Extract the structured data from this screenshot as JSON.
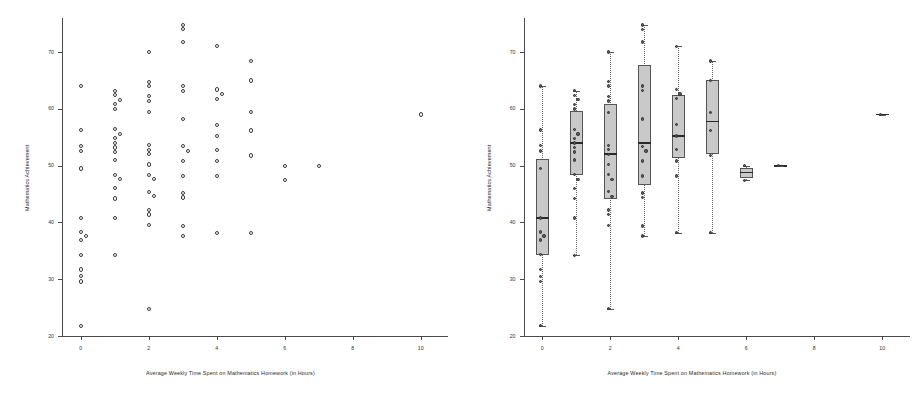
{
  "figure": {
    "panels": [
      {
        "id": "left-panel",
        "kind": "scatter",
        "xlabel": "Average Weekly Time Spent on Mathematics Homework (in Hours)",
        "ylabel": "Mathematics Achievement"
      },
      {
        "id": "right-panel",
        "kind": "boxplot",
        "xlabel": "Average Weekly Time Spent on Mathematics Homework (in Hours)",
        "ylabel": "Mathematics Achievement"
      }
    ]
  },
  "chart_data": [
    {
      "type": "scatter",
      "panel": "left",
      "title": "",
      "xlabel": "Average Weekly Time Spent on Mathematics Homework (in Hours)",
      "ylabel": "Mathematics Achievement",
      "xlim": [
        -0.55,
        10.8
      ],
      "ylim": [
        20,
        76
      ],
      "xticks": [
        0,
        2,
        4,
        6,
        8,
        10
      ],
      "yticks": [
        20,
        30,
        40,
        50,
        60,
        70
      ],
      "xtick_labels": [
        "0",
        "2",
        "4",
        "6",
        "8",
        "10"
      ],
      "ytick_labels": [
        "20",
        "30",
        "40",
        "50",
        "60",
        "70"
      ],
      "grid": false,
      "legend": "none",
      "marker": "open-circle",
      "points": [
        {
          "x": 0,
          "y": 64.0
        },
        {
          "x": 0,
          "y": 56.3
        },
        {
          "x": 0,
          "y": 53.5
        },
        {
          "x": 0,
          "y": 52.6
        },
        {
          "x": 0,
          "y": 49.5
        },
        {
          "x": 0,
          "y": 40.8
        },
        {
          "x": 0,
          "y": 38.3
        },
        {
          "x": 0,
          "y": 37.6
        },
        {
          "x": 0,
          "y": 36.9
        },
        {
          "x": 0,
          "y": 34.3
        },
        {
          "x": 0,
          "y": 31.7
        },
        {
          "x": 0,
          "y": 30.5
        },
        {
          "x": 0,
          "y": 29.6
        },
        {
          "x": 0,
          "y": 21.8
        },
        {
          "x": 1,
          "y": 63.2
        },
        {
          "x": 1,
          "y": 62.4
        },
        {
          "x": 1,
          "y": 61.6
        },
        {
          "x": 1,
          "y": 60.8
        },
        {
          "x": 1,
          "y": 60.0
        },
        {
          "x": 1,
          "y": 56.4
        },
        {
          "x": 1,
          "y": 55.6
        },
        {
          "x": 1,
          "y": 54.8
        },
        {
          "x": 1,
          "y": 54.0
        },
        {
          "x": 1,
          "y": 53.2
        },
        {
          "x": 1,
          "y": 52.4
        },
        {
          "x": 1,
          "y": 51.0
        },
        {
          "x": 1,
          "y": 48.4
        },
        {
          "x": 1,
          "y": 47.6
        },
        {
          "x": 1,
          "y": 46.0
        },
        {
          "x": 1,
          "y": 44.2
        },
        {
          "x": 1,
          "y": 40.8
        },
        {
          "x": 1,
          "y": 34.2
        },
        {
          "x": 2,
          "y": 70.0
        },
        {
          "x": 2,
          "y": 64.8
        },
        {
          "x": 2,
          "y": 64.0
        },
        {
          "x": 2,
          "y": 62.2
        },
        {
          "x": 2,
          "y": 61.4
        },
        {
          "x": 2,
          "y": 59.4
        },
        {
          "x": 2,
          "y": 53.6
        },
        {
          "x": 2,
          "y": 52.8
        },
        {
          "x": 2,
          "y": 52.0
        },
        {
          "x": 2,
          "y": 50.2
        },
        {
          "x": 2,
          "y": 48.4
        },
        {
          "x": 2,
          "y": 47.6
        },
        {
          "x": 2,
          "y": 45.4
        },
        {
          "x": 2,
          "y": 44.6
        },
        {
          "x": 2,
          "y": 42.2
        },
        {
          "x": 2,
          "y": 41.4
        },
        {
          "x": 2,
          "y": 39.5
        },
        {
          "x": 2,
          "y": 24.8
        },
        {
          "x": 3,
          "y": 74.8
        },
        {
          "x": 3,
          "y": 74.0
        },
        {
          "x": 3,
          "y": 71.8
        },
        {
          "x": 3,
          "y": 64.0
        },
        {
          "x": 3,
          "y": 63.2
        },
        {
          "x": 3,
          "y": 58.2
        },
        {
          "x": 3,
          "y": 53.4
        },
        {
          "x": 3,
          "y": 52.6
        },
        {
          "x": 3,
          "y": 50.8
        },
        {
          "x": 3,
          "y": 48.2
        },
        {
          "x": 3,
          "y": 45.2
        },
        {
          "x": 3,
          "y": 44.4
        },
        {
          "x": 3,
          "y": 39.4
        },
        {
          "x": 3,
          "y": 37.6
        },
        {
          "x": 4,
          "y": 71.0
        },
        {
          "x": 4,
          "y": 63.4
        },
        {
          "x": 4,
          "y": 62.6
        },
        {
          "x": 4,
          "y": 61.8
        },
        {
          "x": 4,
          "y": 57.2
        },
        {
          "x": 4,
          "y": 55.2
        },
        {
          "x": 4,
          "y": 52.8
        },
        {
          "x": 4,
          "y": 50.8
        },
        {
          "x": 4,
          "y": 48.2
        },
        {
          "x": 4,
          "y": 38.2
        },
        {
          "x": 5,
          "y": 68.4
        },
        {
          "x": 5,
          "y": 65.0
        },
        {
          "x": 5,
          "y": 59.4
        },
        {
          "x": 5,
          "y": 56.2
        },
        {
          "x": 5,
          "y": 51.8
        },
        {
          "x": 5,
          "y": 38.2
        },
        {
          "x": 6,
          "y": 50.0
        },
        {
          "x": 6,
          "y": 47.4
        },
        {
          "x": 7,
          "y": 50.0
        },
        {
          "x": 10,
          "y": 59.0
        }
      ]
    },
    {
      "type": "boxplot",
      "panel": "right",
      "title": "",
      "xlabel": "Average Weekly Time Spent on Mathematics Homework (in Hours)",
      "ylabel": "Mathematics Achievement",
      "xlim": [
        -0.55,
        10.8
      ],
      "ylim": [
        20,
        76
      ],
      "xticks": [
        0,
        2,
        4,
        6,
        8,
        10
      ],
      "yticks": [
        20,
        30,
        40,
        50,
        60,
        70
      ],
      "xtick_labels": [
        "0",
        "2",
        "4",
        "6",
        "8",
        "10"
      ],
      "ytick_labels": [
        "20",
        "30",
        "40",
        "50",
        "60",
        "70"
      ],
      "grid": false,
      "legend": "none",
      "overlay_points": true,
      "boxes": [
        {
          "x": 0,
          "whisker_low": 21.8,
          "q1": 34.3,
          "median": 40.8,
          "q3": 51.2,
          "whisker_high": 64.0
        },
        {
          "x": 1,
          "whisker_low": 34.2,
          "q1": 48.4,
          "median": 54.0,
          "q3": 59.6,
          "whisker_high": 63.2
        },
        {
          "x": 2,
          "whisker_low": 24.8,
          "q1": 44.2,
          "median": 52.0,
          "q3": 60.8,
          "whisker_high": 70.0
        },
        {
          "x": 3,
          "whisker_low": 37.6,
          "q1": 46.6,
          "median": 54.0,
          "q3": 67.8,
          "whisker_high": 74.8
        },
        {
          "x": 4,
          "whisker_low": 38.2,
          "q1": 51.4,
          "median": 55.2,
          "q3": 62.4,
          "whisker_high": 71.0
        },
        {
          "x": 5,
          "whisker_low": 38.2,
          "q1": 52.0,
          "median": 57.8,
          "q3": 65.0,
          "whisker_high": 68.4
        },
        {
          "x": 6,
          "whisker_low": 47.4,
          "q1": 47.8,
          "median": 48.8,
          "q3": 49.6,
          "whisker_high": 50.0
        },
        {
          "x": 7,
          "whisker_low": 50.0,
          "q1": 50.0,
          "median": 50.0,
          "q3": 50.0,
          "whisker_high": 50.0
        },
        {
          "x": 10,
          "whisker_low": 59.0,
          "q1": 59.0,
          "median": 59.0,
          "q3": 59.0,
          "whisker_high": 59.0
        }
      ]
    }
  ]
}
